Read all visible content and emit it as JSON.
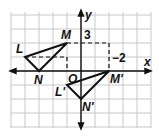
{
  "diagram": {
    "type": "coordinate-plane-transformation",
    "axes": {
      "x_label": "x",
      "y_label": "y",
      "origin_label": "O"
    },
    "grid": {
      "x_min": -5,
      "x_max": 5,
      "y_min": -4,
      "y_max": 4,
      "unit_px": 14
    },
    "original_triangle": {
      "name": "LMN",
      "vertices": [
        {
          "label": "L",
          "x": -4,
          "y": 1
        },
        {
          "label": "M",
          "x": -1,
          "y": 2
        },
        {
          "label": "N",
          "x": -3,
          "y": 0
        }
      ]
    },
    "image_triangle": {
      "name": "L'M'N'",
      "vertices": [
        {
          "label": "L'",
          "x": -1,
          "y": -1
        },
        {
          "label": "M'",
          "x": 2,
          "y": 0
        },
        {
          "label": "N'",
          "x": 0,
          "y": -2
        }
      ]
    },
    "annotations": [
      {
        "text": "3",
        "meaning": "horizontal distance from M to y-axis line toward M'"
      },
      {
        "text": "−2",
        "meaning": "vertical change to M'"
      }
    ],
    "colors": {
      "grid": "#c8c8c8",
      "lines": "#111111",
      "background": "#ffffff"
    }
  }
}
